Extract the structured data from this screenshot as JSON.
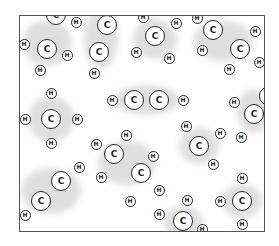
{
  "diagram": {
    "title": "",
    "frame": {
      "left": 19,
      "top": 15,
      "right": 265,
      "bottom": 232,
      "border_color": "#555555"
    },
    "colors": {
      "cloud": "#d9d9d9",
      "atom_fill": "#ffffff",
      "atom_stroke": "#222222"
    },
    "labels": {
      "carbon": "C",
      "hydrogen": "H"
    },
    "clouds": [
      {
        "x": 46,
        "y": 42,
        "w": 50,
        "h": 46
      },
      {
        "x": 100,
        "y": 38,
        "w": 34,
        "h": 60
      },
      {
        "x": 154,
        "y": 38,
        "w": 44,
        "h": 40
      },
      {
        "x": 222,
        "y": 40,
        "w": 60,
        "h": 40
      },
      {
        "x": 50,
        "y": 118,
        "w": 46,
        "h": 46
      },
      {
        "x": 145,
        "y": 99,
        "w": 66,
        "h": 30
      },
      {
        "x": 253,
        "y": 110,
        "w": 34,
        "h": 44
      },
      {
        "x": 126,
        "y": 162,
        "w": 58,
        "h": 44
      },
      {
        "x": 198,
        "y": 145,
        "w": 40,
        "h": 36
      },
      {
        "x": 50,
        "y": 190,
        "w": 60,
        "h": 46
      },
      {
        "x": 241,
        "y": 200,
        "w": 40,
        "h": 34
      },
      {
        "x": 182,
        "y": 220,
        "w": 40,
        "h": 30
      }
    ],
    "atoms": [
      {
        "el": "C",
        "x": 55,
        "y": 14
      },
      {
        "el": "C",
        "x": 46,
        "y": 48
      },
      {
        "el": "H",
        "x": 23,
        "y": 43
      },
      {
        "el": "H",
        "x": 66,
        "y": 54
      },
      {
        "el": "H",
        "x": 39,
        "y": 69
      },
      {
        "el": "H",
        "x": 75,
        "y": 21
      },
      {
        "el": "C",
        "x": 106,
        "y": 24
      },
      {
        "el": "C",
        "x": 98,
        "y": 51
      },
      {
        "el": "H",
        "x": 93,
        "y": 72
      },
      {
        "el": "H",
        "x": 142,
        "y": 16
      },
      {
        "el": "C",
        "x": 154,
        "y": 35
      },
      {
        "el": "H",
        "x": 135,
        "y": 51
      },
      {
        "el": "H",
        "x": 168,
        "y": 57
      },
      {
        "el": "H",
        "x": 175,
        "y": 22
      },
      {
        "el": "H",
        "x": 196,
        "y": 17
      },
      {
        "el": "C",
        "x": 212,
        "y": 29
      },
      {
        "el": "H",
        "x": 254,
        "y": 30
      },
      {
        "el": "C",
        "x": 239,
        "y": 48
      },
      {
        "el": "H",
        "x": 201,
        "y": 49
      },
      {
        "el": "H",
        "x": 258,
        "y": 61
      },
      {
        "el": "H",
        "x": 228,
        "y": 68
      },
      {
        "el": "H",
        "x": 50,
        "y": 92
      },
      {
        "el": "C",
        "x": 50,
        "y": 118
      },
      {
        "el": "H",
        "x": 24,
        "y": 118
      },
      {
        "el": "H",
        "x": 76,
        "y": 118
      },
      {
        "el": "H",
        "x": 50,
        "y": 142
      },
      {
        "el": "H",
        "x": 111,
        "y": 99
      },
      {
        "el": "C",
        "x": 133,
        "y": 99
      },
      {
        "el": "C",
        "x": 158,
        "y": 99
      },
      {
        "el": "H",
        "x": 182,
        "y": 99
      },
      {
        "el": "H",
        "x": 233,
        "y": 101
      },
      {
        "el": "C",
        "x": 253,
        "y": 113
      },
      {
        "el": "H",
        "x": 240,
        "y": 136
      },
      {
        "el": "C",
        "x": 268,
        "y": 95
      },
      {
        "el": "H",
        "x": 95,
        "y": 143
      },
      {
        "el": "C",
        "x": 113,
        "y": 153
      },
      {
        "el": "H",
        "x": 125,
        "y": 134
      },
      {
        "el": "H",
        "x": 100,
        "y": 176
      },
      {
        "el": "C",
        "x": 140,
        "y": 172
      },
      {
        "el": "H",
        "x": 152,
        "y": 155
      },
      {
        "el": "H",
        "x": 158,
        "y": 189
      },
      {
        "el": "H",
        "x": 129,
        "y": 200
      },
      {
        "el": "H",
        "x": 185,
        "y": 125
      },
      {
        "el": "C",
        "x": 198,
        "y": 145
      },
      {
        "el": "H",
        "x": 219,
        "y": 132
      },
      {
        "el": "H",
        "x": 212,
        "y": 163
      },
      {
        "el": "C",
        "x": 60,
        "y": 180
      },
      {
        "el": "C",
        "x": 40,
        "y": 200
      },
      {
        "el": "H",
        "x": 78,
        "y": 166
      },
      {
        "el": "H",
        "x": 24,
        "y": 214
      },
      {
        "el": "H",
        "x": 241,
        "y": 177
      },
      {
        "el": "C",
        "x": 241,
        "y": 200
      },
      {
        "el": "H",
        "x": 219,
        "y": 200
      },
      {
        "el": "H",
        "x": 241,
        "y": 223
      },
      {
        "el": "H",
        "x": 186,
        "y": 199
      },
      {
        "el": "H",
        "x": 158,
        "y": 213
      },
      {
        "el": "C",
        "x": 182,
        "y": 220
      },
      {
        "el": "H",
        "x": 201,
        "y": 228
      }
    ]
  }
}
